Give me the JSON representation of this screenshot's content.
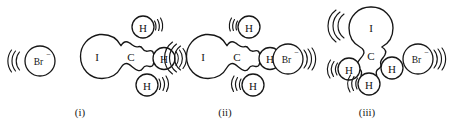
{
  "figure": {
    "background_color": "#ffffff",
    "ink_color": "#161616"
  },
  "panels": [
    {
      "id": "panel-i",
      "caption": "(i)",
      "atoms": {
        "bromide": "Br",
        "bromide_charge": "−",
        "iodine": "I",
        "carbon": "C",
        "hydrogen_top": "H",
        "hydrogen_right": "H",
        "hydrogen_bottom": "H"
      }
    },
    {
      "id": "panel-ii",
      "caption": "(ii)",
      "atoms": {
        "bromide": "Br",
        "bromide_charge": "−",
        "iodine": "I",
        "carbon": "C",
        "hydrogen_top": "H",
        "hydrogen_right": "H",
        "hydrogen_bottom": "H"
      }
    },
    {
      "id": "panel-iii",
      "caption": "(iii)",
      "atoms": {
        "bromide": "Br",
        "bromide_charge": "−",
        "iodine": "I",
        "carbon": "C",
        "hydrogen_left": "H",
        "hydrogen_bottom": "H",
        "hydrogen_right": "H"
      }
    }
  ]
}
